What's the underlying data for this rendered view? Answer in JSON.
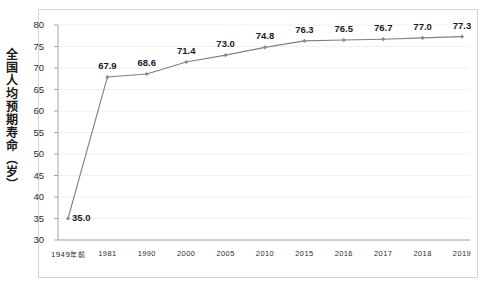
{
  "chart_data": {
    "type": "line",
    "title": "",
    "xlabel": "",
    "ylabel": "全国人均预期寿命（岁）",
    "categories": [
      "1949年前",
      "1981",
      "1990",
      "2000",
      "2005",
      "2010",
      "2015",
      "2016",
      "2017",
      "2018",
      "2019"
    ],
    "values": [
      35.0,
      67.9,
      68.6,
      71.4,
      73.0,
      74.8,
      76.3,
      76.5,
      76.7,
      77.0,
      77.3
    ],
    "data_labels": [
      "35.0",
      "67.9",
      "68.6",
      "71.4",
      "73.0",
      "74.8",
      "76.3",
      "76.5",
      "76.7",
      "77.0",
      "77.3"
    ],
    "ylim": [
      30,
      80
    ],
    "ytick_labels": [
      "80",
      "75",
      "70",
      "65",
      "60",
      "55",
      "50",
      "45",
      "40",
      "35",
      "30"
    ],
    "ytick_values": [
      80,
      75,
      70,
      65,
      60,
      55,
      50,
      45,
      40,
      35,
      30
    ],
    "grid": true,
    "legend": false,
    "series_color": "#808080",
    "marker": "diamond",
    "marker_color": "#8a8a8a",
    "grid_color": "#ececec",
    "axis_color": "#a6a6a6",
    "frame_color": "#d3d3d3"
  },
  "axis_title": {
    "text": "全国人均预期寿命（岁）"
  }
}
